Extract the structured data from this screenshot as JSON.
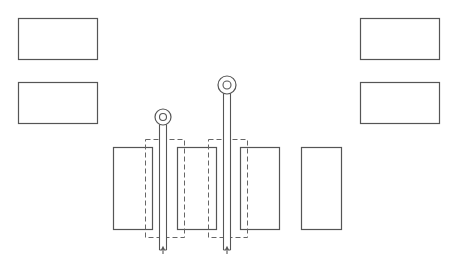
{
  "diagram": {
    "stroke_color": "#555555",
    "dash_color": "#666666",
    "background": "#ffffff",
    "top_left_boxes": [
      {
        "x": 18,
        "y": 18,
        "w": 79,
        "h": 41
      },
      {
        "x": 18,
        "y": 82,
        "w": 79,
        "h": 41
      }
    ],
    "top_right_boxes": [
      {
        "x": 360,
        "y": 18,
        "w": 79,
        "h": 41
      },
      {
        "x": 360,
        "y": 82,
        "w": 79,
        "h": 41
      }
    ],
    "bottom_plates": [
      {
        "x": 113,
        "y": 147,
        "w": 39,
        "h": 82
      },
      {
        "x": 177,
        "y": 147,
        "w": 39,
        "h": 82
      },
      {
        "x": 240,
        "y": 147,
        "w": 39,
        "h": 82
      },
      {
        "x": 301,
        "y": 147,
        "w": 40,
        "h": 82
      }
    ],
    "dashed_frames": [
      {
        "x": 145,
        "y": 139,
        "w": 39,
        "h": 98
      },
      {
        "x": 208,
        "y": 139,
        "w": 39,
        "h": 98
      }
    ],
    "probes": [
      {
        "cx": 163,
        "ring_cy": 117,
        "ring_r": 8,
        "hole_r": 3.5,
        "shaft_half": 3.5,
        "bottom": 250
      },
      {
        "cx": 227,
        "ring_cy": 85,
        "ring_r": 9,
        "hole_r": 4,
        "shaft_half": 3.5,
        "bottom": 250
      }
    ]
  }
}
